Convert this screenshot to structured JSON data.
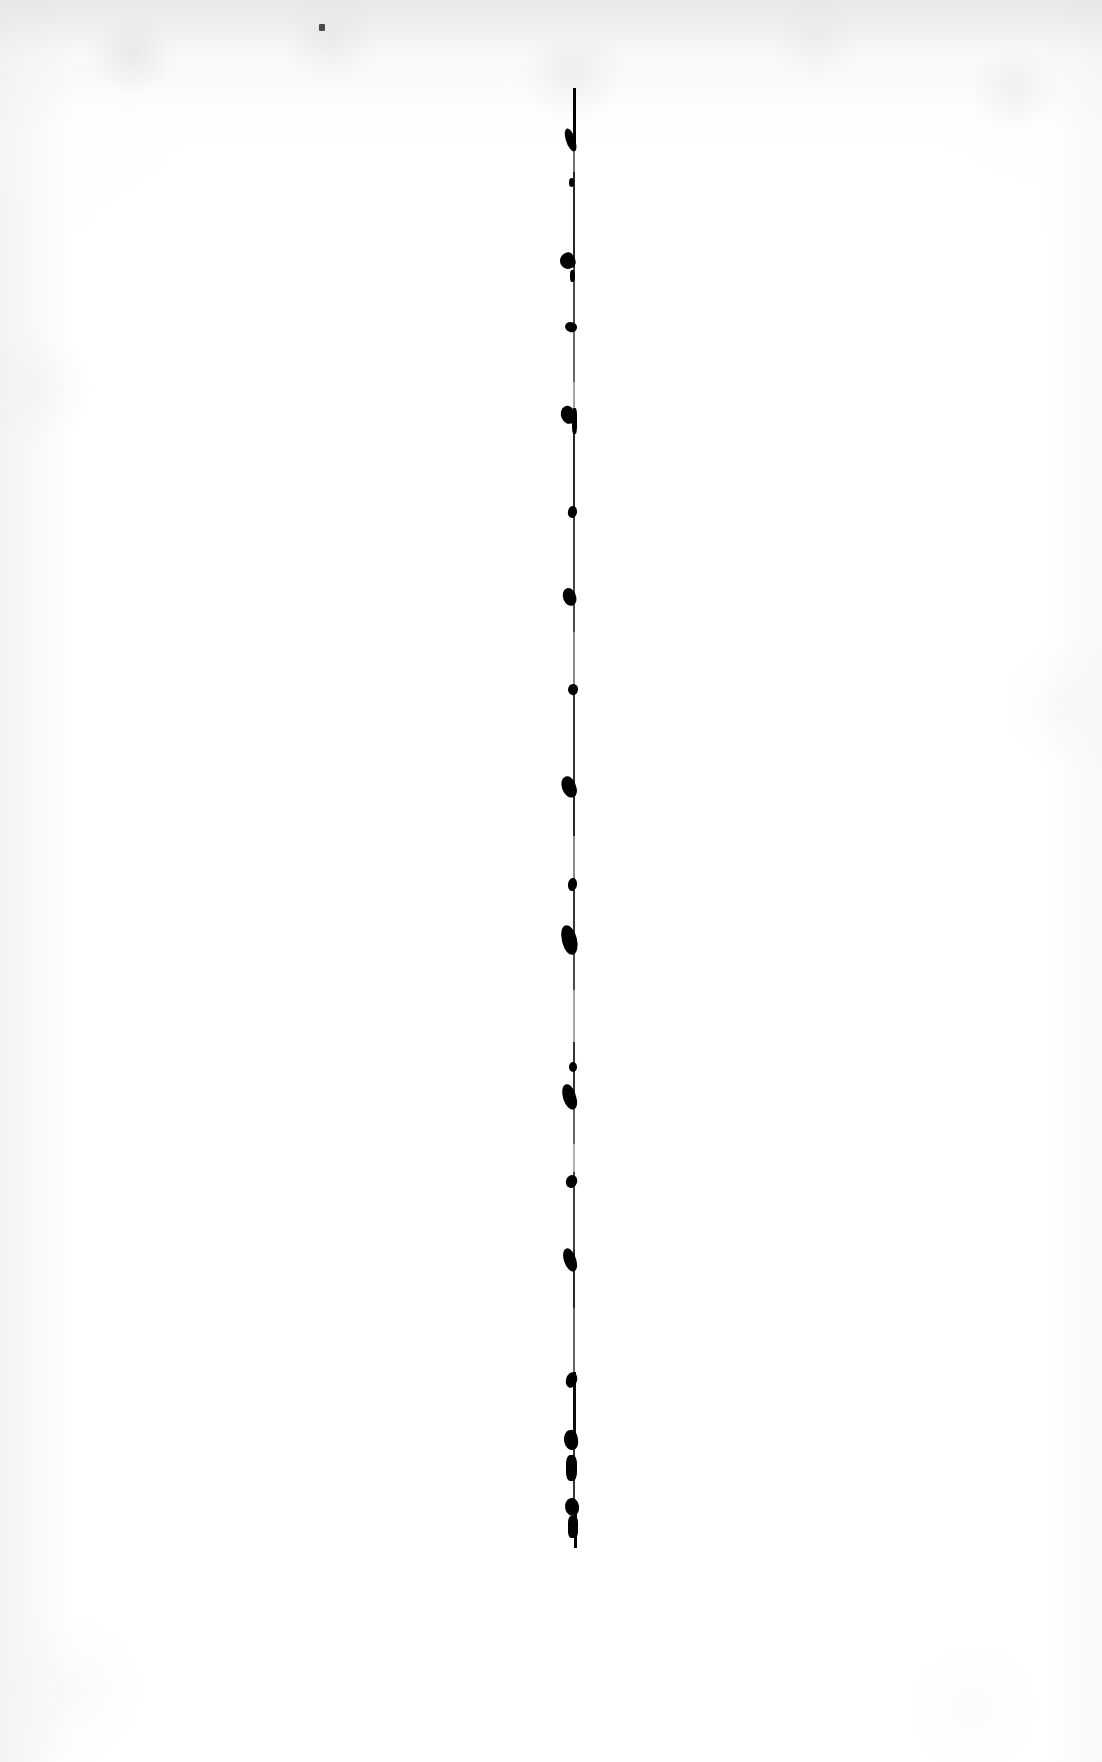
{
  "document": {
    "title": "Scanned page",
    "kind": "scanned-document-page",
    "page_width": 1102,
    "page_height": 1762,
    "background_color": "#ffffff",
    "ink_color": "#000000",
    "visible_text": "",
    "note": "Blank scanned sheet; only artifacts are a vertical ink rule and a stray dot."
  },
  "artifacts": {
    "vertical_rule": {
      "name": "vertical-ink-rule",
      "color": "#000000",
      "center_x": 574,
      "top_y": 88,
      "bottom_y": 1548,
      "thickness_px": 2,
      "segments": [
        {
          "x": 573,
          "y": 88,
          "w": 3,
          "h": 62,
          "opacity": 1.0
        },
        {
          "x": 573,
          "y": 150,
          "w": 2,
          "h": 22,
          "opacity": 0.55
        },
        {
          "x": 573,
          "y": 172,
          "w": 2,
          "h": 96,
          "opacity": 0.85
        },
        {
          "x": 573,
          "y": 268,
          "w": 2,
          "h": 64,
          "opacity": 0.7
        },
        {
          "x": 573,
          "y": 332,
          "w": 2,
          "h": 50,
          "opacity": 0.6
        },
        {
          "x": 573,
          "y": 382,
          "w": 2,
          "h": 28,
          "opacity": 0.35
        },
        {
          "x": 573,
          "y": 410,
          "w": 2,
          "h": 100,
          "opacity": 0.85
        },
        {
          "x": 573,
          "y": 510,
          "w": 2,
          "h": 78,
          "opacity": 0.75
        },
        {
          "x": 573,
          "y": 588,
          "w": 2,
          "h": 44,
          "opacity": 0.7
        },
        {
          "x": 573,
          "y": 632,
          "w": 2,
          "h": 52,
          "opacity": 0.45
        },
        {
          "x": 573,
          "y": 684,
          "w": 2,
          "h": 96,
          "opacity": 0.8
        },
        {
          "x": 573,
          "y": 780,
          "w": 2,
          "h": 56,
          "opacity": 0.85
        },
        {
          "x": 573,
          "y": 836,
          "w": 2,
          "h": 42,
          "opacity": 0.45
        },
        {
          "x": 573,
          "y": 878,
          "w": 2,
          "h": 68,
          "opacity": 0.8
        },
        {
          "x": 573,
          "y": 946,
          "w": 2,
          "h": 44,
          "opacity": 0.7
        },
        {
          "x": 573,
          "y": 990,
          "w": 2,
          "h": 52,
          "opacity": 0.35
        },
        {
          "x": 573,
          "y": 1042,
          "w": 2,
          "h": 62,
          "opacity": 0.8
        },
        {
          "x": 573,
          "y": 1104,
          "w": 2,
          "h": 40,
          "opacity": 0.6
        },
        {
          "x": 573,
          "y": 1144,
          "w": 2,
          "h": 28,
          "opacity": 0.3
        },
        {
          "x": 573,
          "y": 1172,
          "w": 2,
          "h": 78,
          "opacity": 0.75
        },
        {
          "x": 573,
          "y": 1250,
          "w": 2,
          "h": 58,
          "opacity": 0.85
        },
        {
          "x": 573,
          "y": 1308,
          "w": 2,
          "h": 64,
          "opacity": 0.6
        },
        {
          "x": 573,
          "y": 1372,
          "w": 3,
          "h": 64,
          "opacity": 0.95
        },
        {
          "x": 573,
          "y": 1436,
          "w": 2,
          "h": 70,
          "opacity": 0.8
        },
        {
          "x": 574,
          "y": 1506,
          "w": 3,
          "h": 42,
          "opacity": 1.0
        }
      ]
    },
    "ink_blobs": [
      {
        "name": "ink-blob-1",
        "x": 566,
        "y": 128,
        "w": 9,
        "h": 24,
        "skew": -16,
        "radius": "46% 54% 40% 60%"
      },
      {
        "name": "ink-blob-2",
        "x": 569,
        "y": 178,
        "w": 5,
        "h": 9,
        "skew": 0,
        "radius": "50%"
      },
      {
        "name": "ink-blob-3",
        "x": 560,
        "y": 253,
        "w": 15,
        "h": 16,
        "skew": -28,
        "radius": "60% 40% 45% 55%"
      },
      {
        "name": "ink-blob-4",
        "x": 570,
        "y": 270,
        "w": 5,
        "h": 12,
        "skew": 0,
        "radius": "40%"
      },
      {
        "name": "ink-blob-5",
        "x": 565,
        "y": 322,
        "w": 12,
        "h": 10,
        "skew": 22,
        "radius": "55% 45% 50% 50%"
      },
      {
        "name": "ink-blob-6",
        "x": 561,
        "y": 406,
        "w": 14,
        "h": 18,
        "skew": -24,
        "radius": "58% 42% 48% 52%"
      },
      {
        "name": "ink-blob-7",
        "x": 572,
        "y": 408,
        "w": 5,
        "h": 26,
        "skew": 0,
        "radius": "30%"
      },
      {
        "name": "ink-blob-8",
        "x": 568,
        "y": 506,
        "w": 9,
        "h": 12,
        "skew": 12,
        "radius": "45% 55% 50% 50%"
      },
      {
        "name": "ink-blob-9",
        "x": 563,
        "y": 588,
        "w": 13,
        "h": 18,
        "skew": -22,
        "radius": "55% 45% 50% 50%"
      },
      {
        "name": "ink-blob-10",
        "x": 568,
        "y": 684,
        "w": 10,
        "h": 11,
        "skew": 18,
        "radius": "50% 50% 45% 55%"
      },
      {
        "name": "ink-blob-11",
        "x": 562,
        "y": 776,
        "w": 14,
        "h": 22,
        "skew": -20,
        "radius": "52% 48% 46% 54%"
      },
      {
        "name": "ink-blob-12",
        "x": 568,
        "y": 878,
        "w": 9,
        "h": 13,
        "skew": 10,
        "radius": "48% 52% 50% 50%"
      },
      {
        "name": "ink-blob-13",
        "x": 562,
        "y": 925,
        "w": 15,
        "h": 30,
        "skew": -14,
        "radius": "48% 52% 52% 48%"
      },
      {
        "name": "ink-blob-14",
        "x": 569,
        "y": 1062,
        "w": 8,
        "h": 10,
        "skew": 0,
        "radius": "50%"
      },
      {
        "name": "ink-blob-15",
        "x": 563,
        "y": 1084,
        "w": 13,
        "h": 26,
        "skew": -18,
        "radius": "54% 46% 48% 52%"
      },
      {
        "name": "ink-blob-16",
        "x": 566,
        "y": 1175,
        "w": 11,
        "h": 13,
        "skew": 20,
        "radius": "52% 48% 48% 52%"
      },
      {
        "name": "ink-blob-17",
        "x": 564,
        "y": 1248,
        "w": 12,
        "h": 24,
        "skew": -18,
        "radius": "50% 50% 46% 54%"
      },
      {
        "name": "ink-blob-18",
        "x": 566,
        "y": 1372,
        "w": 11,
        "h": 16,
        "skew": 16,
        "radius": "50% 50% 50% 50%"
      },
      {
        "name": "ink-blob-19",
        "x": 564,
        "y": 1430,
        "w": 14,
        "h": 20,
        "skew": -10,
        "radius": "56% 44% 48% 52%"
      },
      {
        "name": "ink-blob-20",
        "x": 566,
        "y": 1455,
        "w": 11,
        "h": 26,
        "skew": 0,
        "radius": "35%"
      },
      {
        "name": "ink-blob-21",
        "x": 565,
        "y": 1498,
        "w": 14,
        "h": 18,
        "skew": -12,
        "radius": "54% 46% 50% 50%"
      },
      {
        "name": "ink-blob-22",
        "x": 568,
        "y": 1516,
        "w": 10,
        "h": 22,
        "skew": 0,
        "radius": "30%"
      }
    ],
    "stray_dot": {
      "name": "stray-speck",
      "x": 319,
      "y": 24,
      "w": 6,
      "h": 7,
      "color": "#4a4a4a"
    }
  }
}
